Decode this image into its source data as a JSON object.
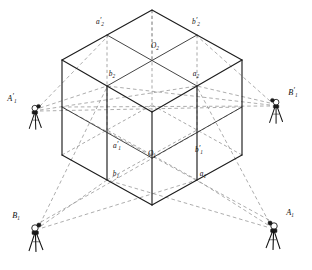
{
  "figure": {
    "type": "engineering-survey-diagram",
    "background_color": "#ffffff",
    "line_colors": {
      "solid_edge": "#1d1d1d",
      "hidden_edge": "#8c8c8c",
      "sight_ray": "#8a8a8a",
      "instrument": "#141414",
      "label_text": "#111111"
    }
  },
  "cube": {
    "projection": "isometric",
    "top_face_center_label": "O2",
    "bottom_face_center_label": "O1",
    "vertices": {
      "top_apex": [
        152,
        10
      ],
      "top_left": [
        62,
        60
      ],
      "top_front": [
        152,
        112
      ],
      "top_right": [
        242,
        60
      ],
      "bottom_left": [
        62,
        155
      ],
      "bottom_front": [
        152,
        205
      ],
      "bottom_right": [
        242,
        155
      ]
    },
    "midpoints": {
      "top_upper_left": [
        107,
        35
      ],
      "top_upper_right": [
        197,
        35
      ],
      "top_front_left": [
        107,
        86
      ],
      "top_front_right": [
        197,
        86
      ],
      "top_center": [
        152,
        61
      ],
      "bottom_front_left": [
        107,
        180
      ],
      "bottom_front_right": [
        197,
        180
      ],
      "bottom_center": [
        152,
        155
      ],
      "bottom_left_mid": [
        62,
        107
      ],
      "bottom_right_mid": [
        242,
        107
      ]
    }
  },
  "labels": {
    "points": [
      {
        "id": "a2p",
        "base": "a",
        "sub": "2",
        "prime": true,
        "x": 100,
        "y": 24,
        "anchor": "middle"
      },
      {
        "id": "b2p",
        "base": "b",
        "sub": "2",
        "prime": true,
        "x": 196,
        "y": 24,
        "anchor": "middle"
      },
      {
        "id": "O2",
        "base": "O",
        "sub": "2",
        "prime": false,
        "x": 155,
        "y": 48,
        "anchor": "middle"
      },
      {
        "id": "b2",
        "base": "b",
        "sub": "2",
        "prime": false,
        "x": 112,
        "y": 76,
        "anchor": "middle"
      },
      {
        "id": "a2",
        "base": "a",
        "sub": "2",
        "prime": false,
        "x": 196,
        "y": 76,
        "anchor": "middle"
      },
      {
        "id": "a1p",
        "base": "a",
        "sub": "1",
        "prime": true,
        "x": 117,
        "y": 148,
        "anchor": "middle"
      },
      {
        "id": "O1",
        "base": "O",
        "sub": "1",
        "prime": false,
        "x": 152,
        "y": 156,
        "anchor": "middle"
      },
      {
        "id": "b1p",
        "base": "b",
        "sub": "1",
        "prime": true,
        "x": 199,
        "y": 152,
        "anchor": "middle"
      },
      {
        "id": "b1",
        "base": "b",
        "sub": "1",
        "prime": false,
        "x": 116,
        "y": 176,
        "anchor": "middle"
      },
      {
        "id": "a1",
        "base": "a",
        "sub": "1",
        "prime": false,
        "x": 203,
        "y": 176,
        "anchor": "middle"
      }
    ],
    "stations": [
      {
        "id": "A1p",
        "base": "A",
        "sub": "1",
        "prime": true,
        "x": 12,
        "y": 101,
        "anchor": "middle"
      },
      {
        "id": "B1p",
        "base": "B",
        "sub": "1",
        "prime": true,
        "x": 293,
        "y": 95,
        "anchor": "middle"
      },
      {
        "id": "B1",
        "base": "B",
        "sub": "1",
        "prime": false,
        "x": 16,
        "y": 218,
        "anchor": "middle"
      },
      {
        "id": "A1",
        "base": "A",
        "sub": "1",
        "prime": false,
        "x": 290,
        "y": 215,
        "anchor": "middle"
      }
    ]
  },
  "instruments": [
    {
      "id": "station-A1-prime",
      "label": "A1'",
      "head_x": 33,
      "head_y": 110,
      "position": "left-middle"
    },
    {
      "id": "station-B1-prime",
      "label": "B1'",
      "head_x": 277,
      "head_y": 104,
      "position": "right-middle"
    },
    {
      "id": "station-B1",
      "label": "B1",
      "head_x": 34,
      "head_y": 230,
      "position": "bottom-left"
    },
    {
      "id": "station-A1",
      "label": "A1",
      "head_x": 275,
      "head_y": 228,
      "position": "bottom-right"
    }
  ],
  "sight_rays": [
    {
      "from": "A1p",
      "to_x": 107,
      "to_y": 86
    },
    {
      "from": "A1p",
      "to_x": 107,
      "to_y": 35
    },
    {
      "from": "A1p",
      "to_x": 197,
      "to_y": 86
    },
    {
      "from": "A1p",
      "to_x": 242,
      "to_y": 107
    },
    {
      "from": "B1p",
      "to_x": 197,
      "to_y": 86
    },
    {
      "from": "B1p",
      "to_x": 197,
      "to_y": 35
    },
    {
      "from": "B1p",
      "to_x": 107,
      "to_y": 86
    },
    {
      "from": "B1p",
      "to_x": 62,
      "to_y": 107
    },
    {
      "from": "B1",
      "to_x": 107,
      "to_y": 86
    },
    {
      "from": "B1",
      "to_x": 107,
      "to_y": 180
    },
    {
      "from": "B1",
      "to_x": 197,
      "to_y": 180
    },
    {
      "from": "B1",
      "to_x": 242,
      "to_y": 107
    },
    {
      "from": "A1",
      "to_x": 197,
      "to_y": 86
    },
    {
      "from": "A1",
      "to_x": 197,
      "to_y": 180
    },
    {
      "from": "A1",
      "to_x": 107,
      "to_y": 180
    },
    {
      "from": "A1",
      "to_x": 62,
      "to_y": 107
    }
  ]
}
